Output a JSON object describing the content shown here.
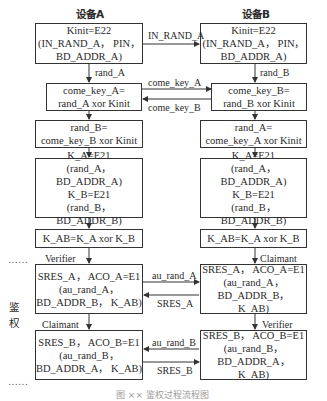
{
  "headers": {
    "device_a": "设备A",
    "device_b": "设备B"
  },
  "side_label": {
    "line1": "鉴",
    "line2": "权"
  },
  "dots": {
    "top": "……",
    "bottom": "……"
  },
  "device_a": {
    "kinit": [
      "Kinit=E22",
      "(IN_RAND_A， PIN，",
      "BD_ADDR_A)"
    ],
    "come_key": [
      "come_key_A=",
      "rand_A xor Kinit"
    ],
    "rand_recv": [
      "rand_B=",
      "come_key_B xor Kinit"
    ],
    "link_keys": [
      "K_A=E21",
      "(rand_A， BD_ADDR_A)",
      "K_B=E21",
      "(rand_B， BD_ADDR_B)"
    ],
    "kab": "K_AB=K_A xor K_B",
    "auth1": [
      "SRES_A， ACO_A=E1",
      "(au_rand_A，",
      "BD_ADDR_B， K_AB)"
    ],
    "auth2": [
      "SRES_B， ACO_B=E1",
      "(au_rand_B，",
      "BD_ADDR_A， K_AB)"
    ],
    "role1": "Verifier",
    "role2": "Claimant",
    "arrow1": "rand_A"
  },
  "device_b": {
    "kinit": [
      "Kinit=E22",
      "(IN_RAND_A， PIN，",
      "BD_ADDR_A)"
    ],
    "come_key": [
      "come_key_B=",
      "rand_B xor Kinit"
    ],
    "rand_recv": [
      "rand_A=",
      "come_key_A xor Kinit"
    ],
    "link_keys": [
      "K_A=E21",
      "(rand_A， BD_ADDR_A)",
      "K_B=E21",
      "(rand_B， BD_ADDR_B)"
    ],
    "kab": "K_AB=K_A xor K_B",
    "auth1": [
      "SRES_A， ACO_A=E1",
      "(au_rand_A，",
      "BD_ADDR_B， K_AB)"
    ],
    "auth2": [
      "SRES_B， ACO_B=E1",
      "(au_rand_B，",
      "BD_ADDR_A， K_AB)"
    ],
    "role1": "Claimant",
    "role2": "Verifier",
    "arrow1": "rand_B"
  },
  "messages": {
    "in_rand": "IN_RAND_A",
    "come_key_a": "come_key_A",
    "come_key_b": "come_key_B",
    "au_rand_a": "au_rand_A",
    "sres_a": "SRES_A",
    "au_rand_b": "au_rand_B",
    "sres_b": "SRES_B"
  },
  "caption": "图 ×× 鉴权过程流程图"
}
